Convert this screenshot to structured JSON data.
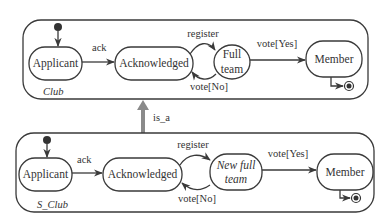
{
  "diagram": {
    "type": "uml-statechart-inheritance",
    "colors": {
      "line": "#3a3a3a",
      "text": "#333333",
      "is_a_arrow": "#8a8a8a",
      "background": "#ffffff"
    },
    "top": {
      "name": "Club",
      "states": {
        "applicant": "Applicant",
        "acknowledged": "Acknowledged",
        "full_team_line1": "Full",
        "full_team_line2": "team",
        "member": "Member"
      },
      "transitions": {
        "ack": "ack",
        "register": "register",
        "vote_no": "vote[No]",
        "vote_yes": "vote[Yes]"
      }
    },
    "relation": {
      "label": "is_a"
    },
    "bottom": {
      "name": "S_Club",
      "states": {
        "applicant": "Applicant",
        "acknowledged": "Acknowledged",
        "new_full_team_line1": "New full",
        "new_full_team_line2": "team",
        "member": "Member"
      },
      "transitions": {
        "ack": "ack",
        "register": "register",
        "vote_no": "vote[No]",
        "vote_yes": "vote[Yes]"
      }
    }
  }
}
